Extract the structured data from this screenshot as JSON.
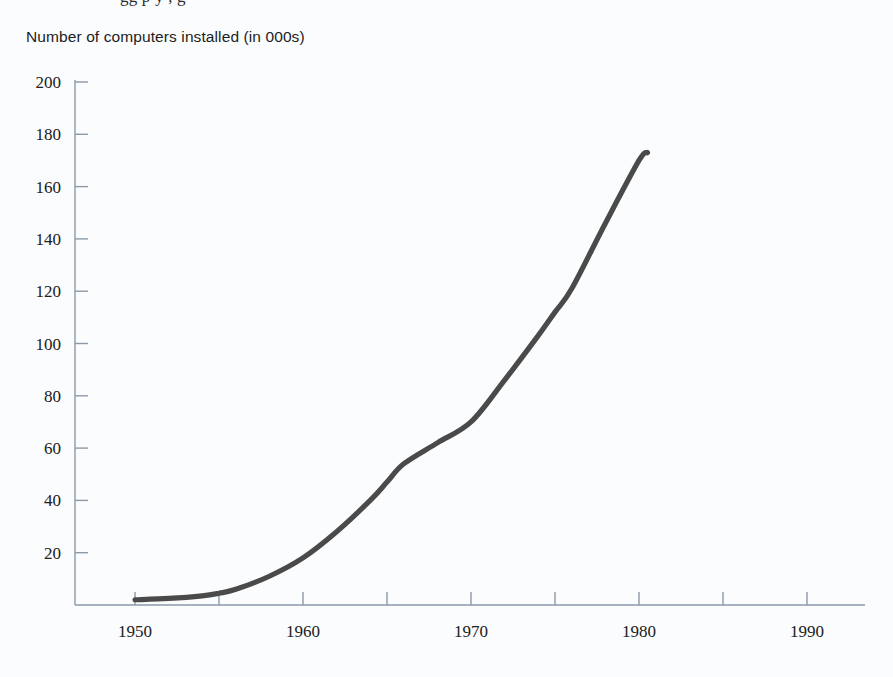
{
  "page": {
    "background_color": "#fbfcfd",
    "top_cropped_text": "gg p y , g"
  },
  "chart_title": "Number of computers installed (in 000s)",
  "colors": {
    "curve": "#4a4a4a",
    "axis": "#8c9aa8",
    "text": "#1d1d1d"
  },
  "chart_data": {
    "type": "line",
    "title": "Number of computers installed (in 000s)",
    "xlabel": "",
    "ylabel": "Number of computers installed (in 000s)",
    "xlim": [
      1946,
      1996
    ],
    "ylim": [
      0,
      200
    ],
    "grid": false,
    "legend": null,
    "y_ticks": [
      20,
      40,
      60,
      80,
      100,
      120,
      140,
      160,
      180,
      200
    ],
    "y_tick_labels": [
      "20",
      "40",
      "60",
      "80",
      "100",
      "120",
      "140",
      "160",
      "180",
      "200"
    ],
    "x_ticks": [
      1950,
      1955,
      1960,
      1965,
      1970,
      1975,
      1980,
      1985,
      1990
    ],
    "x_tick_labels": [
      "1950",
      "",
      "1960",
      "",
      "1970",
      "",
      "1980",
      "",
      "1990"
    ],
    "x_major_labels": [
      "1950",
      "1960",
      "1970",
      "1980",
      "1990"
    ],
    "series": [
      {
        "name": "Computers installed",
        "color": "#4a4a4a",
        "x": [
          1950,
          1952,
          1954,
          1955,
          1956,
          1958,
          1960,
          1962,
          1964,
          1965,
          1966,
          1968,
          1970,
          1972,
          1974,
          1975,
          1976,
          1978,
          1980,
          1980.5
        ],
        "values": [
          2,
          2.5,
          3.5,
          4.5,
          6,
          11,
          18,
          28,
          40,
          47,
          54,
          62,
          70,
          86,
          103,
          112,
          121,
          146,
          170,
          173
        ]
      }
    ]
  }
}
